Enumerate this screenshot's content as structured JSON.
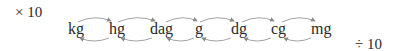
{
  "diagram": {
    "multiply_label": "× 10",
    "divide_label": "÷ 10",
    "units": [
      {
        "label": "kg",
        "x": 68
      },
      {
        "label": "hg",
        "x": 109
      },
      {
        "label": "dag",
        "x": 150
      },
      {
        "label": "g",
        "x": 195
      },
      {
        "label": "dg",
        "x": 231
      },
      {
        "label": "cg",
        "x": 271
      },
      {
        "label": "mg",
        "x": 311
      }
    ],
    "arrow_color": "#8a8a8a",
    "top_arrows_direction": "right",
    "bottom_arrows_direction": "left"
  }
}
